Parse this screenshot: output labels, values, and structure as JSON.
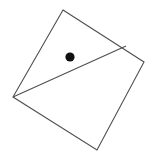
{
  "figure": {
    "background_color": "#ffffff",
    "canvas": {
      "width": 152,
      "height": 156
    },
    "stroke_color": "#4f4f4f",
    "stroke_width": 1.1,
    "dot_color": "#101010",
    "shapes": {
      "quadrilateral": {
        "name": "rotated-square",
        "points": "63,10 144,62 97,150 13,97",
        "vertices": [
          {
            "label": "top",
            "x": 63,
            "y": 10
          },
          {
            "label": "right",
            "x": 144,
            "y": 62
          },
          {
            "label": "bottom",
            "x": 97,
            "y": 150
          },
          {
            "label": "left",
            "x": 13,
            "y": 97
          }
        ]
      },
      "chord": {
        "name": "interior-diagonal",
        "x1": 13,
        "y1": 97,
        "x2": 126,
        "y2": 46
      },
      "dot": {
        "name": "point-marker",
        "cx": 70,
        "cy": 57,
        "r": 4.6
      }
    }
  }
}
